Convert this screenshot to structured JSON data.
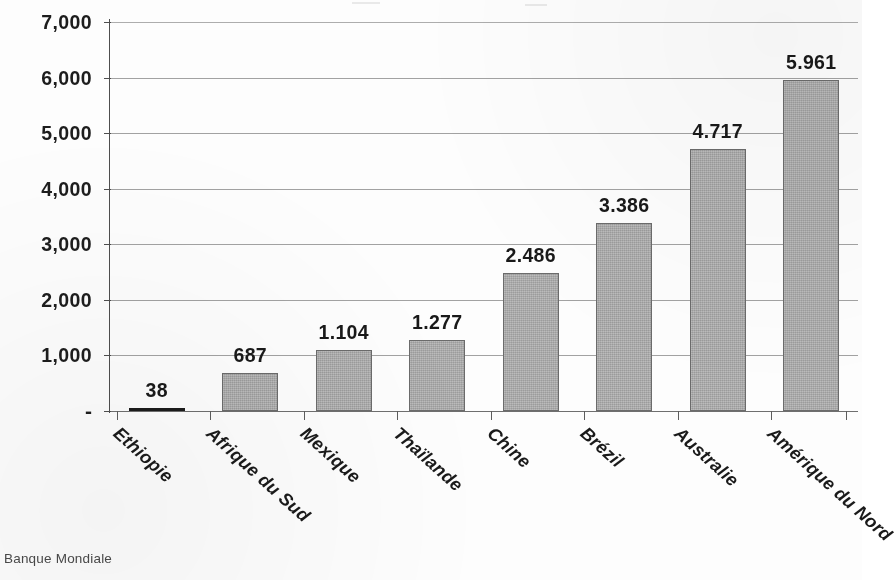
{
  "chart_data": {
    "type": "bar",
    "title": "",
    "subtitle": "",
    "xlabel": "",
    "ylabel": "",
    "categories": [
      "Ethiopie",
      "Afrique du Sud",
      "Mexique",
      "Thaïlande",
      "Chine",
      "Brézil",
      "Australie",
      "Amérique du Nord"
    ],
    "values": [
      38,
      687,
      1104,
      1277,
      2486,
      3386,
      4717,
      5961
    ],
    "value_labels": [
      "38",
      "687",
      "1.104",
      "1.277",
      "2.486",
      "3.386",
      "4.717",
      "5.961"
    ],
    "ylim": [
      0,
      7000
    ],
    "ytick_values": [
      0,
      1000,
      2000,
      3000,
      4000,
      5000,
      6000,
      7000
    ],
    "ytick_labels": [
      "-",
      "1,000",
      "2,000",
      "3,000",
      "4,000",
      "5,000",
      "6,000",
      "7,000"
    ],
    "grid": true,
    "legend": false,
    "legend_position": "none",
    "bar_color": "#a9a9a9",
    "bar_border_color": "#6b6b6b",
    "grid_color": "#8e8e8e",
    "axis_color": "#4e4e4e",
    "text_color": "#1a1a1a",
    "xtick_rotation": 42
  },
  "source": {
    "caption": "Banque Mondiale"
  }
}
